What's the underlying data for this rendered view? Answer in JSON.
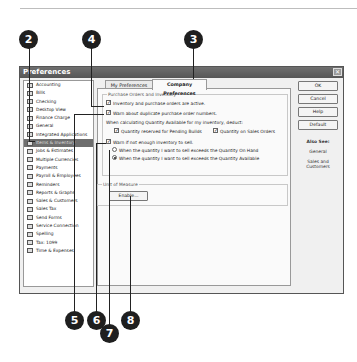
{
  "window": {
    "title": "Preferences",
    "close_glyph": "✕"
  },
  "sidebar": {
    "items": [
      {
        "label": "Accounting",
        "icon": "accounting-icon",
        "selected": false
      },
      {
        "label": "Bills",
        "icon": "bills-icon",
        "selected": false
      },
      {
        "label": "Checking",
        "icon": "checking-icon",
        "selected": false
      },
      {
        "label": "Desktop View",
        "icon": "desktop-view-icon",
        "selected": false
      },
      {
        "label": "Finance Charge",
        "icon": "finance-charge-icon",
        "selected": false
      },
      {
        "label": "General",
        "icon": "general-icon",
        "selected": false
      },
      {
        "label": "Integrated Applications",
        "icon": "integrated-applications-icon",
        "selected": false
      },
      {
        "label": "Items & Inventory",
        "icon": "items-inventory-icon",
        "selected": true
      },
      {
        "label": "Jobs & Estimates",
        "icon": "jobs-estimates-icon",
        "selected": false
      },
      {
        "label": "Multiple Currencies",
        "icon": "multiple-currencies-icon",
        "selected": false
      },
      {
        "label": "Payments",
        "icon": "payments-icon",
        "selected": false
      },
      {
        "label": "Payroll & Employees",
        "icon": "payroll-icon",
        "selected": false
      },
      {
        "label": "Reminders",
        "icon": "reminders-icon",
        "selected": false
      },
      {
        "label": "Reports & Graphs",
        "icon": "reports-graphs-icon",
        "selected": false
      },
      {
        "label": "Sales & Customers",
        "icon": "sales-customers-icon",
        "selected": false
      },
      {
        "label": "Sales Tax",
        "icon": "sales-tax-icon",
        "selected": false
      },
      {
        "label": "Send Forms",
        "icon": "send-forms-icon",
        "selected": false
      },
      {
        "label": "Service Connection",
        "icon": "service-connection-icon",
        "selected": false
      },
      {
        "label": "Spelling",
        "icon": "spelling-icon",
        "selected": false
      },
      {
        "label": "Tax: 1099",
        "icon": "tax-1099-icon",
        "selected": false
      },
      {
        "label": "Time & Expenses",
        "icon": "time-expenses-icon",
        "selected": false
      }
    ]
  },
  "tabs": [
    {
      "label": "My Preferences",
      "active": false
    },
    {
      "label": "Company Preferences",
      "active": true
    }
  ],
  "purchase_orders_group": {
    "label": "Purchase Orders and Inventory",
    "inventory_active": {
      "label": "Inventory and purchase orders are active.",
      "checked": true
    },
    "warn_duplicate": {
      "label": "Warn about duplicate purchase order numbers.",
      "checked": true
    },
    "calc_label": "When calculating Quantity Available for my inventory, deduct:",
    "qty_pending_builds": {
      "label": "Quantity reserved for Pending Builds",
      "checked": true
    },
    "qty_sales_orders": {
      "label": "Quantity on Sales Orders",
      "checked": true
    },
    "warn_not_enough": {
      "label": "Warn if not enough inventory to sell.",
      "checked": true
    },
    "radio_on_hand": {
      "label": "When the quantity I want to sell exceeds the Quantity On Hand",
      "selected": false
    },
    "radio_available": {
      "label": "When the quantity I want to sell exceeds the Quantity Available",
      "selected": true
    }
  },
  "unit_of_measure_group": {
    "label": "Unit of Measure",
    "enable_button": "Enable..."
  },
  "buttons": {
    "ok": "OK",
    "cancel": "Cancel",
    "help": "Help",
    "default": "Default"
  },
  "also_see": {
    "heading": "Also See:",
    "links": [
      "General",
      "Sales and Customers"
    ]
  },
  "callouts": [
    "2",
    "4",
    "3",
    "5",
    "6",
    "7",
    "8"
  ],
  "check_glyph": "✓"
}
